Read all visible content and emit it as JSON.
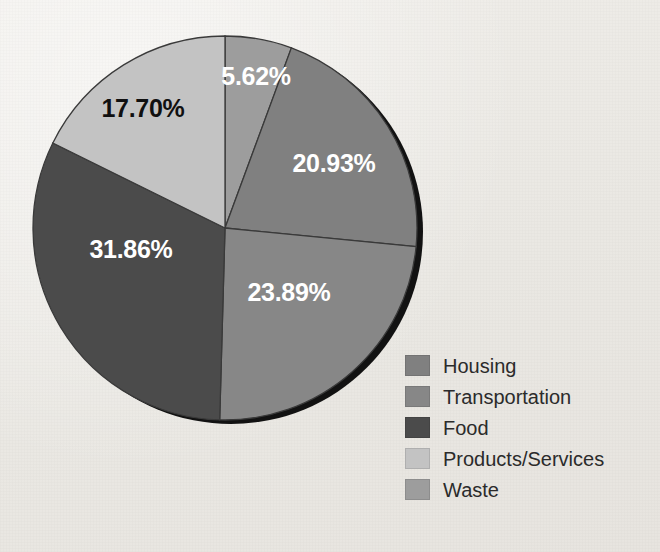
{
  "chart_data": {
    "type": "pie",
    "title": "",
    "subtitle": "",
    "xlabel": "",
    "ylabel": "",
    "grid": false,
    "legend_position": "bottom-right",
    "start_angle_deg": 0,
    "direction": "clockwise",
    "background_color": "#edebe7",
    "slice_outline_color": "#3a3a3a",
    "shadow_color": "#121212",
    "categories": [
      "Waste",
      "Housing",
      "Transportation",
      "Food",
      "Products/Services"
    ],
    "values": [
      5.62,
      20.93,
      23.89,
      31.86,
      17.7
    ],
    "labels": [
      "5.62%",
      "20.93%",
      "23.89%",
      "31.86%",
      "17.70%"
    ],
    "slices": [
      {
        "name": "Waste",
        "value": 5.62,
        "label": "5.62%",
        "color": "#9d9d9d",
        "label_color": "#ffffff",
        "label_x": 256,
        "label_y": 78
      },
      {
        "name": "Housing",
        "value": 20.93,
        "label": "20.93%",
        "color": "#808080",
        "label_color": "#ffffff",
        "label_x": 334,
        "label_y": 165
      },
      {
        "name": "Transportation",
        "value": 23.89,
        "label": "23.89%",
        "color": "#878787",
        "label_color": "#ffffff",
        "label_x": 289,
        "label_y": 294
      },
      {
        "name": "Food",
        "value": 31.86,
        "label": "31.86%",
        "color": "#4b4b4b",
        "label_color": "#ffffff",
        "label_x": 131,
        "label_y": 251
      },
      {
        "name": "Products/Services",
        "value": 17.7,
        "label": "17.70%",
        "color": "#c3c3c3",
        "label_color": "#101010",
        "label_x": 143,
        "label_y": 110
      }
    ]
  },
  "legend": {
    "items": [
      {
        "label": "Housing",
        "color": "#808080"
      },
      {
        "label": "Transportation",
        "color": "#878787"
      },
      {
        "label": "Food",
        "color": "#4b4b4b"
      },
      {
        "label": "Products/Services",
        "color": "#c3c3c3"
      },
      {
        "label": "Waste",
        "color": "#9d9d9d"
      }
    ]
  },
  "geometry": {
    "center_x": 225,
    "center_y": 228,
    "radius": 192,
    "shadow_offset_x": 6,
    "shadow_offset_y": 4
  }
}
